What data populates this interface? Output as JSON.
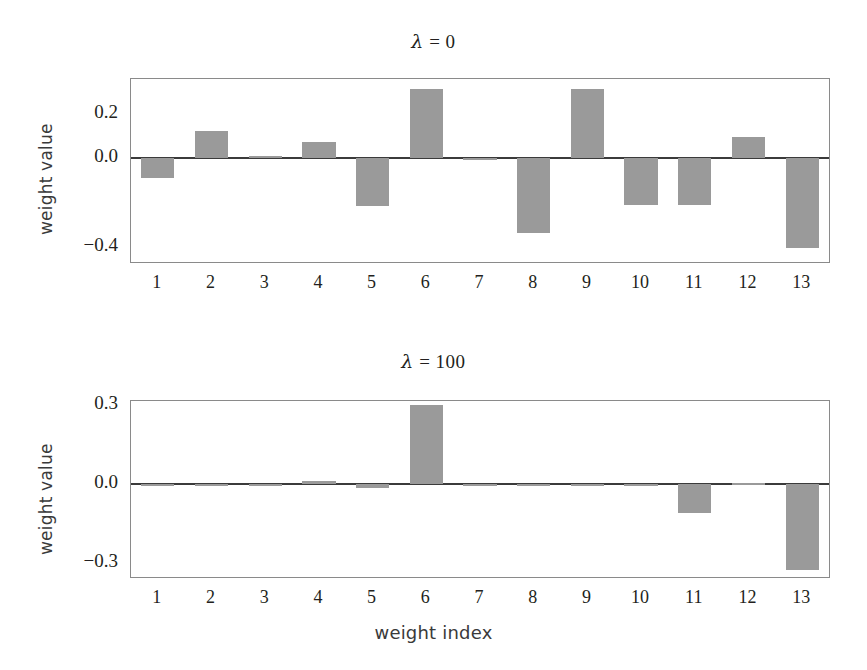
{
  "figure": {
    "xlabel": "weight index",
    "ylabel_top": "weight value",
    "ylabel_bottom": "weight value"
  },
  "chart_data": [
    {
      "type": "bar",
      "title": "λ = 0",
      "title_symbol": "λ",
      "title_rest": " = 0",
      "xlabel": "",
      "ylabel": "weight value",
      "categories": [
        "1",
        "2",
        "3",
        "4",
        "5",
        "6",
        "7",
        "8",
        "9",
        "10",
        "11",
        "12",
        "13"
      ],
      "values": [
        -0.09,
        0.125,
        0.01,
        0.075,
        -0.215,
        0.315,
        -0.005,
        -0.34,
        0.315,
        -0.21,
        -0.21,
        0.095,
        -0.405
      ],
      "ylim": [
        -0.47,
        0.36
      ],
      "yticks": [
        0.2,
        0.0,
        -0.2,
        -0.4
      ],
      "ytick_labels": [
        "0.2",
        "0.0",
        "",
        "−0.4"
      ],
      "grid": false,
      "legend": "none",
      "bar_color": "#9a9a9a"
    },
    {
      "type": "bar",
      "title": "λ = 100",
      "title_symbol": "λ",
      "title_rest": " = 100",
      "xlabel": "weight index",
      "ylabel": "weight value",
      "categories": [
        "1",
        "2",
        "3",
        "4",
        "5",
        "6",
        "7",
        "8",
        "9",
        "10",
        "11",
        "12",
        "13"
      ],
      "values": [
        -0.008,
        -0.003,
        0.0,
        0.012,
        -0.018,
        0.3,
        0.0,
        0.0,
        0.0,
        0.0,
        -0.11,
        0.004,
        -0.33
      ],
      "ylim": [
        -0.355,
        0.315
      ],
      "yticks": [
        0.3,
        0.0,
        -0.3
      ],
      "ytick_labels": [
        "0.3",
        "0.0",
        "−0.3"
      ],
      "grid": false,
      "legend": "none",
      "bar_color": "#9a9a9a"
    }
  ]
}
